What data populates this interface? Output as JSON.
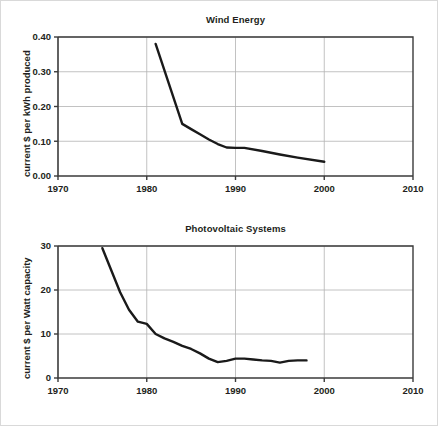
{
  "figure": {
    "background_color": "#ffffff",
    "border_color": "#d9d9d9",
    "line_color": "#1a1a1a",
    "grid_color": "#b3b3b3",
    "axis_color": "#3b3b3b"
  },
  "chart_data": [
    {
      "type": "line",
      "id": "wind-energy",
      "title": "Wind Energy",
      "xlabel": "",
      "ylabel": "current $ per kWh produced",
      "xlim": [
        1970,
        2010
      ],
      "ylim": [
        0.0,
        0.4
      ],
      "xticks": [
        1970,
        1980,
        1990,
        2000,
        2010
      ],
      "xtick_labels": [
        "1970",
        "1980",
        "1990",
        "2000",
        "2010"
      ],
      "yticks": [
        0.0,
        0.1,
        0.2,
        0.3,
        0.4
      ],
      "ytick_labels": [
        "0.00",
        "0.10",
        "0.20",
        "0.30",
        "0.40"
      ],
      "grid": "horizontal-and-vertical",
      "legend": "none",
      "series": [
        {
          "name": "cost of wind energy",
          "x": [
            1981,
            1984,
            1985,
            1986,
            1987,
            1988,
            1989,
            1990,
            1991,
            1993,
            1995,
            1997,
            2000
          ],
          "y": [
            0.38,
            0.15,
            0.135,
            0.12,
            0.105,
            0.092,
            0.082,
            0.081,
            0.081,
            0.072,
            0.062,
            0.053,
            0.041
          ]
        }
      ]
    },
    {
      "type": "line",
      "id": "photovoltaic-systems",
      "title": "Photovoltaic Systems",
      "xlabel": "",
      "ylabel": "current $ per Watt capacity",
      "xlim": [
        1970,
        2010
      ],
      "ylim": [
        0,
        30
      ],
      "xticks": [
        1970,
        1980,
        1990,
        2000,
        2010
      ],
      "xtick_labels": [
        "1970",
        "1980",
        "1990",
        "2000",
        "2010"
      ],
      "yticks": [
        0,
        10,
        20,
        30
      ],
      "ytick_labels": [
        "0",
        "10",
        "20",
        "30"
      ],
      "grid": "horizontal-and-vertical",
      "legend": "none",
      "series": [
        {
          "name": "cost of photovoltaic systems",
          "x": [
            1975,
            1976,
            1977,
            1978,
            1979,
            1980,
            1981,
            1982,
            1983,
            1984,
            1985,
            1986,
            1987,
            1988,
            1989,
            1990,
            1991,
            1992,
            1993,
            1994,
            1995,
            1996,
            1997,
            1998
          ],
          "y": [
            29.5,
            24.5,
            19.5,
            15.5,
            12.8,
            12.3,
            10.0,
            9.0,
            8.2,
            7.3,
            6.6,
            5.6,
            4.4,
            3.6,
            3.9,
            4.4,
            4.4,
            4.2,
            4.0,
            3.9,
            3.5,
            3.9,
            4.0,
            4.0
          ]
        }
      ]
    }
  ]
}
